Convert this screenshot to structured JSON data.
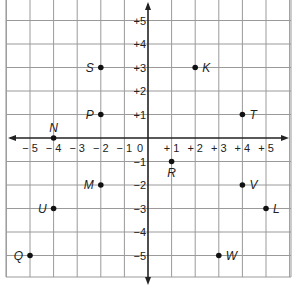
{
  "chart_data": {
    "type": "scatter",
    "title": "",
    "xlabel": "",
    "ylabel": "",
    "xlim": [
      -5.8,
      6.1
    ],
    "ylim": [
      -5.9,
      5.9
    ],
    "grid": true,
    "x_ticks": [
      "-5",
      "-4",
      "-3",
      "-2",
      "-1",
      "0",
      "+1",
      "+2",
      "+3",
      "+4",
      "+5"
    ],
    "y_ticks": [
      "+5",
      "+4",
      "+3",
      "+2",
      "+1",
      "-1",
      "-2",
      "-3",
      "-4",
      "-5"
    ],
    "origin_label": "0",
    "points": [
      {
        "label": "S",
        "x": -2,
        "y": 3,
        "label_side": "left"
      },
      {
        "label": "K",
        "x": 2,
        "y": 3,
        "label_side": "right"
      },
      {
        "label": "P",
        "x": -2,
        "y": 1,
        "label_side": "left"
      },
      {
        "label": "T",
        "x": 4,
        "y": 1,
        "label_side": "right"
      },
      {
        "label": "N",
        "x": -4,
        "y": 0,
        "label_side": "above"
      },
      {
        "label": "R",
        "x": 1,
        "y": -1,
        "label_side": "below"
      },
      {
        "label": "M",
        "x": -2,
        "y": -2,
        "label_side": "left"
      },
      {
        "label": "V",
        "x": 4,
        "y": -2,
        "label_side": "right"
      },
      {
        "label": "U",
        "x": -4,
        "y": -3,
        "label_side": "left"
      },
      {
        "label": "L",
        "x": 5,
        "y": -3,
        "label_side": "right"
      },
      {
        "label": "Q",
        "x": -5,
        "y": -5,
        "label_side": "left"
      },
      {
        "label": "W",
        "x": 3,
        "y": -5,
        "label_side": "right"
      }
    ]
  },
  "colors": {
    "grid": "#9a9a9a",
    "axis": "#222222",
    "point": "#111111",
    "text": "#222222"
  }
}
